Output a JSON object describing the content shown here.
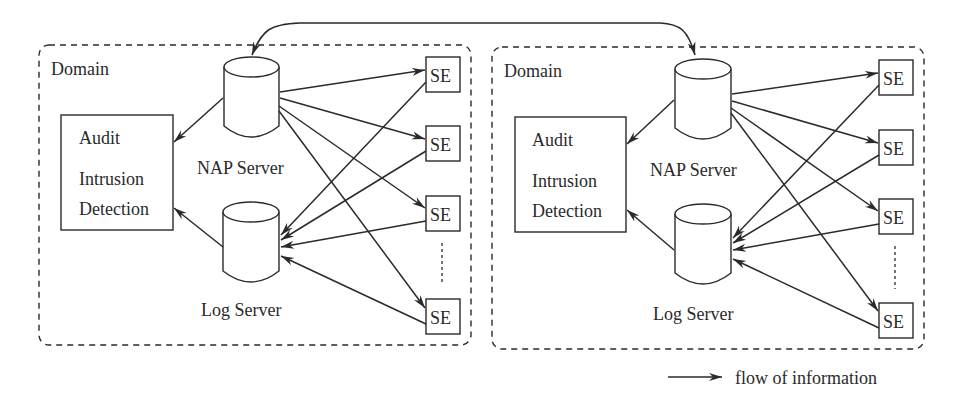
{
  "diagram": {
    "colors": {
      "stroke": "#2a2a2a",
      "background": "#ffffff"
    },
    "domains": [
      {
        "label": "Domain",
        "audit_box": {
          "line1": "Audit",
          "line2": "Intrusion",
          "line3": "Detection"
        },
        "nap_server": "NAP Server",
        "log_server": "Log Server",
        "se_nodes": [
          "SE",
          "SE",
          "SE",
          "SE"
        ]
      },
      {
        "label": "Domain",
        "audit_box": {
          "line1": "Audit",
          "line2": "Intrusion",
          "line3": "Detection"
        },
        "nap_server": "NAP Server",
        "log_server": "Log Server",
        "se_nodes": [
          "SE",
          "SE",
          "SE",
          "SE"
        ]
      }
    ],
    "legend": {
      "icon": "arrow-right-icon",
      "label": "flow of information"
    }
  }
}
